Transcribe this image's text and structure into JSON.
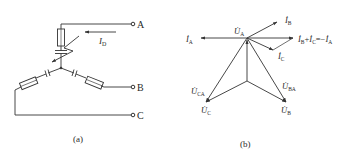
{
  "figure_a": {
    "caption": "(a)",
    "terminals": [
      {
        "name": "A",
        "label": "A"
      },
      {
        "name": "B",
        "label": "B"
      },
      {
        "name": "C",
        "label": "C"
      }
    ],
    "current_label": {
      "main": "I",
      "sub": "D"
    }
  },
  "figure_b": {
    "caption": "(b)",
    "phasors": {
      "IA": {
        "main": "İ",
        "sub": "A"
      },
      "IB": {
        "main": "İ",
        "sub": "B"
      },
      "IC": {
        "main": "İ",
        "sub": "C"
      },
      "UA": {
        "main": "U̇",
        "sub": "A"
      },
      "UB": {
        "main": "U̇",
        "sub": "B"
      },
      "UC": {
        "main": "U̇",
        "sub": "C"
      },
      "UBA": {
        "main": "U̇",
        "sub": "BA"
      },
      "UCA": {
        "main": "U̇",
        "sub": "CA"
      }
    },
    "sum_label": {
      "p1": "İ",
      "s1": "B",
      "plus": "+",
      "p2": "İ",
      "s2": "C",
      "eq": "=−",
      "p3": "İ",
      "s3": "A"
    }
  },
  "colors": {
    "stroke": "#333333",
    "text": "#2a2a2a",
    "background": "#ffffff"
  }
}
